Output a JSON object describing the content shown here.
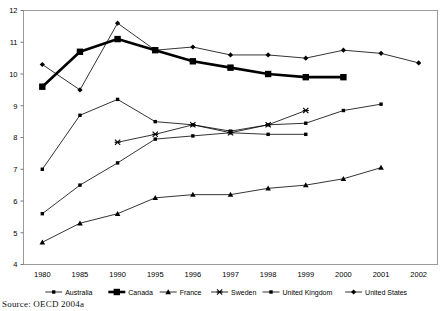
{
  "chart_data": {
    "type": "line",
    "title": "",
    "subtitle": "",
    "xlabel": "",
    "ylabel": "",
    "categories": [
      "1980",
      "1985",
      "1990",
      "1995",
      "1996",
      "1997",
      "1998",
      "1999",
      "2000",
      "2001",
      "2002"
    ],
    "ylim": [
      4,
      12
    ],
    "yticks": [
      4,
      5,
      6,
      7,
      8,
      9,
      10,
      11,
      12
    ],
    "ytick_labels": [
      "4",
      "5",
      "6",
      "7",
      "8",
      "9",
      "10",
      "11",
      "12"
    ],
    "grid": false,
    "legend_position": "bottom",
    "series": [
      {
        "name": "Australia",
        "marker": "square-small",
        "linewidth": 0.8,
        "color": "#000000",
        "x": [
          "1980",
          "1985",
          "1990",
          "1995",
          "1996",
          "1997",
          "1998",
          "1999",
          "2000",
          "2001"
        ],
        "values": [
          7.0,
          8.7,
          9.2,
          8.5,
          8.4,
          8.2,
          8.4,
          8.45,
          8.85,
          9.05
        ]
      },
      {
        "name": "Canada",
        "marker": "square-large",
        "linewidth": 2.6,
        "color": "#000000",
        "x": [
          "1980",
          "1985",
          "1990",
          "1995",
          "1996",
          "1997",
          "1998",
          "1999",
          "2000"
        ],
        "values": [
          9.6,
          10.7,
          11.1,
          10.75,
          10.4,
          10.2,
          10.0,
          9.9,
          9.9
        ]
      },
      {
        "name": "France",
        "marker": "triangle",
        "linewidth": 0.8,
        "color": "#000000",
        "x": [
          "1980",
          "1985",
          "1990",
          "1995",
          "1996",
          "1997",
          "1998",
          "1999",
          "2000",
          "2001"
        ],
        "values": [
          4.7,
          5.3,
          5.6,
          6.1,
          6.2,
          6.2,
          6.4,
          6.5,
          6.7,
          7.05
        ]
      },
      {
        "name": "Sweden",
        "marker": "cross",
        "linewidth": 0.8,
        "color": "#000000",
        "x": [
          "1990",
          "1995",
          "1996",
          "1997",
          "1998",
          "1999"
        ],
        "values": [
          7.85,
          8.1,
          8.4,
          8.15,
          8.4,
          8.85
        ]
      },
      {
        "name": "United Kingdom",
        "marker": "square-small",
        "linewidth": 0.8,
        "color": "#000000",
        "x": [
          "1980",
          "1985",
          "1990",
          "1995",
          "1996",
          "1997",
          "1998",
          "1999"
        ],
        "values": [
          5.6,
          6.5,
          7.2,
          7.95,
          8.05,
          8.15,
          8.1,
          8.1
        ]
      },
      {
        "name": "United States",
        "marker": "diamond",
        "linewidth": 0.8,
        "color": "#000000",
        "x": [
          "1980",
          "1985",
          "1990",
          "1995",
          "1996",
          "1997",
          "1998",
          "1999",
          "2000",
          "2001",
          "2002"
        ],
        "values": [
          10.3,
          9.5,
          11.6,
          10.75,
          10.85,
          10.6,
          10.6,
          10.5,
          10.75,
          10.65,
          10.35
        ]
      }
    ]
  },
  "legend": {
    "items": [
      {
        "label": "Australia"
      },
      {
        "label": "Canada"
      },
      {
        "label": "France"
      },
      {
        "label": "Sweden"
      },
      {
        "label": "United Kingdom"
      },
      {
        "label": "United States"
      }
    ]
  },
  "source": {
    "text": "Source: OECD 2004a"
  }
}
